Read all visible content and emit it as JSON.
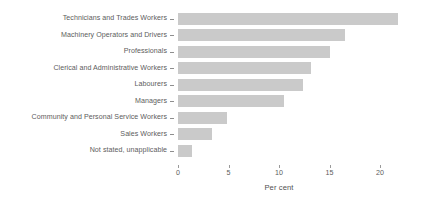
{
  "chart_data": {
    "type": "bar",
    "orientation": "horizontal",
    "title": "",
    "xlabel": "Per cent",
    "ylabel": "",
    "xlim": [
      0,
      22.8
    ],
    "xticks": [
      0,
      5,
      10,
      15,
      20
    ],
    "xtick_labels": [
      "0",
      "5",
      "10",
      "15",
      "20"
    ],
    "grid": false,
    "legend": false,
    "bar_color": "#cacaca",
    "text_color": "#5d5d5d",
    "categories": [
      "Technicians and Trades Workers",
      "Machinery Operators and Drivers",
      "Professionals",
      "Clerical and Administrative Workers",
      "Labourers",
      "Managers",
      "Community and Personal Service Workers",
      "Sales Workers",
      "Not stated, unapplicable"
    ],
    "values": [
      21.8,
      16.5,
      15.0,
      13.2,
      12.4,
      10.5,
      4.9,
      3.4,
      1.4
    ]
  }
}
